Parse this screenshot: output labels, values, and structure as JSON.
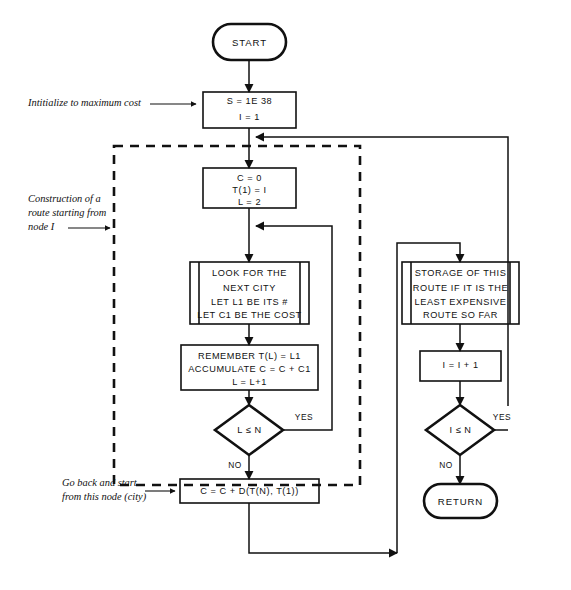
{
  "diagram": {
    "ink_color": "#111111",
    "background": "#ffffff"
  },
  "nodes": {
    "start": {
      "type": "terminator",
      "label": "START"
    },
    "init": {
      "type": "process",
      "lines": [
        "S = 1E 38",
        "I = 1"
      ]
    },
    "route_init": {
      "type": "process",
      "lines": [
        "C = 0",
        "T(1) = I",
        "L = 2"
      ]
    },
    "look_next_city": {
      "type": "predefined-process",
      "lines": [
        "LOOK FOR THE",
        "NEXT CITY",
        "LET L1 BE ITS #",
        "LET C1 BE THE COST"
      ]
    },
    "remember": {
      "type": "process",
      "lines": [
        "REMEMBER T(L) = L1",
        "ACCUMULATE C = C + C1",
        "L = L+1"
      ]
    },
    "decision_l": {
      "type": "decision",
      "label": "L ≤ N",
      "yes_label": "YES",
      "no_label": "NO"
    },
    "close_route": {
      "type": "process",
      "lines": [
        "C = C + D(T(N), T(1))"
      ]
    },
    "storage": {
      "type": "predefined-process",
      "lines": [
        "STORAGE OF THIS",
        "ROUTE IF IT IS THE",
        "LEAST EXPENSIVE",
        "ROUTE SO FAR"
      ]
    },
    "increment_i": {
      "type": "process",
      "lines": [
        "I = I + 1"
      ]
    },
    "decision_i": {
      "type": "decision",
      "label": "I ≤ N",
      "yes_label": "YES",
      "no_label": "NO"
    },
    "return": {
      "type": "terminator",
      "label": "RETURN"
    }
  },
  "annotations": [
    {
      "id": "init-note",
      "lines": [
        "Intitialize to maximum cost"
      ]
    },
    {
      "id": "construction-note",
      "lines": [
        "Construction of a",
        "route starting from",
        "node I"
      ]
    },
    {
      "id": "goback-note",
      "lines": [
        "Go back and start",
        "from this node (city)"
      ]
    }
  ],
  "regions": {
    "dashed_loop": {
      "style": "dashed",
      "description": "route construction loop boundary"
    }
  }
}
